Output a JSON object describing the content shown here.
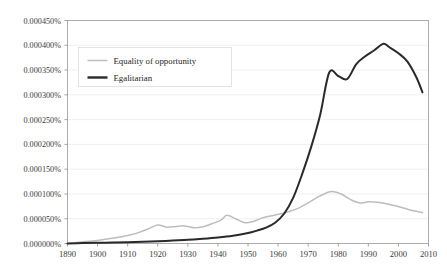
{
  "chart_data": {
    "type": "line",
    "title": "",
    "xlabel": "",
    "ylabel": "",
    "xlim": [
      1890,
      2010
    ],
    "ylim": [
      0.0,
      0.00045
    ],
    "grid": true,
    "grid_axis": "y",
    "legend_position": "upper-left-inside",
    "y_tick_labels": [
      "0.000450%",
      "0.000400%",
      "0.000350%",
      "0.000300%",
      "0.000250%",
      "0.000200%",
      "0.000150%",
      "0.000100%",
      "0.000050%",
      "0.000000%"
    ],
    "y_tick_values": [
      0.00045,
      0.0004,
      0.00035,
      0.0003,
      0.00025,
      0.0002,
      0.00015,
      0.0001,
      5e-05,
      0.0
    ],
    "x_tick_labels": [
      "1890",
      "1900",
      "1910",
      "1920",
      "1930",
      "1940",
      "1950",
      "1960",
      "1970",
      "1980",
      "1990",
      "2000",
      "2010"
    ],
    "x_tick_values": [
      1890,
      1900,
      1910,
      1920,
      1930,
      1940,
      1950,
      1960,
      1970,
      1980,
      1990,
      2000,
      2010
    ],
    "series": [
      {
        "name": "Equality of opportunity",
        "color": "#bdbdbd",
        "line_width": 1.5,
        "x": [
          1890,
          1893,
          1896,
          1899,
          1902,
          1905,
          1908,
          1911,
          1914,
          1917,
          1920,
          1923,
          1926,
          1929,
          1932,
          1935,
          1938,
          1941,
          1943,
          1946,
          1949,
          1952,
          1955,
          1958,
          1961,
          1964,
          1967,
          1970,
          1973,
          1976,
          1978,
          1981,
          1984,
          1987,
          1990,
          1993,
          1996,
          1999,
          2002,
          2005,
          2008
        ],
        "y": [
          0.0,
          2e-06,
          4e-06,
          5.5e-06,
          8e-06,
          1.05e-05,
          1.35e-05,
          1.75e-05,
          2.3e-05,
          3e-05,
          3.75e-05,
          3.3e-05,
          3.45e-05,
          3.55e-05,
          3.2e-05,
          3.4e-05,
          4e-05,
          4.7e-05,
          5.7e-05,
          4.95e-05,
          4.2e-05,
          4.5e-05,
          5.2e-05,
          5.6e-05,
          6e-05,
          6.5e-05,
          7.2e-05,
          8.2e-05,
          9.3e-05,
          0.000102,
          0.000105,
          0.0001,
          8.9e-05,
          8.2e-05,
          8.4e-05,
          8.3e-05,
          8e-05,
          7.6e-05,
          7.1e-05,
          6.6e-05,
          6.25e-05
        ]
      },
      {
        "name": "Egalitarian",
        "color": "#2a2a2a",
        "line_width": 2.0,
        "x": [
          1890,
          1895,
          1900,
          1905,
          1910,
          1915,
          1920,
          1925,
          1930,
          1935,
          1940,
          1945,
          1950,
          1953,
          1956,
          1959,
          1962,
          1965,
          1968,
          1971,
          1974,
          1977,
          1980,
          1983,
          1986,
          1989,
          1992,
          1995,
          1997,
          2000,
          2003,
          2006,
          2008
        ],
        "y": [
          0.0,
          1e-06,
          1.5e-06,
          2e-06,
          2.5e-06,
          3.5e-06,
          4.5e-06,
          6e-06,
          7.5e-06,
          9.5e-06,
          1.2e-05,
          1.55e-05,
          2.1e-05,
          2.6e-05,
          3.2e-05,
          4.2e-05,
          6e-05,
          9.2e-05,
          0.00014,
          0.000195,
          0.00026,
          0.000345,
          0.000338,
          0.000332,
          0.000362,
          0.000378,
          0.00039,
          0.000403,
          0.000396,
          0.000384,
          0.000367,
          0.000335,
          0.000305
        ]
      }
    ]
  },
  "legend": {
    "entries": [
      {
        "label": "Equality of opportunity",
        "color": "#bdbdbd"
      },
      {
        "label": "Egalitarian",
        "color": "#2a2a2a"
      }
    ]
  }
}
